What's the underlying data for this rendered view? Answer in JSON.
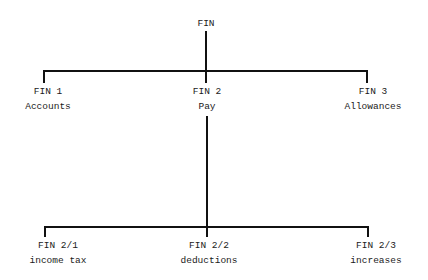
{
  "diagram": {
    "type": "hierarchy-tree",
    "root": {
      "code": "FIN"
    },
    "level1": [
      {
        "code": "FIN 1",
        "label": "Accounts"
      },
      {
        "code": "FIN 2",
        "label": "Pay"
      },
      {
        "code": "FIN 3",
        "label": "Allowances"
      }
    ],
    "level2": [
      {
        "parent": "FIN 2",
        "code": "FIN 2/1",
        "label": "income tax"
      },
      {
        "parent": "FIN 2",
        "code": "FIN 2/2",
        "label": "deductions"
      },
      {
        "parent": "FIN 2",
        "code": "FIN 2/3",
        "label": "increases"
      }
    ],
    "line_color": "#111111"
  }
}
